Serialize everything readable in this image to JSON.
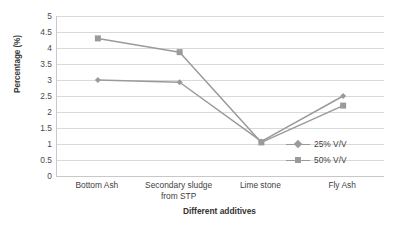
{
  "chart_data": {
    "type": "line",
    "title": "",
    "xlabel": "Different additives",
    "ylabel": "Percentage (%)",
    "categories": [
      "Bottom Ash",
      "Secondary sludge from STP",
      "Lime stone",
      "Fly Ash"
    ],
    "category_lines": [
      [
        "Bottom Ash"
      ],
      [
        "Secondary sludge",
        "from STP"
      ],
      [
        "Lime stone"
      ],
      [
        "Fly Ash"
      ]
    ],
    "series": [
      {
        "name": "25% V/V",
        "marker": "diamond",
        "color": "#9a9a9a",
        "values": [
          3.0,
          2.93,
          1.08,
          2.5
        ]
      },
      {
        "name": "50% V/V",
        "marker": "square",
        "color": "#9a9a9a",
        "values": [
          4.3,
          3.87,
          1.05,
          2.2
        ]
      }
    ],
    "ylim": [
      0,
      5
    ],
    "ytick_step": 0.5,
    "ytick_labels": [
      "5",
      "4.5",
      "4",
      "3.5",
      "3",
      "2.5",
      "2",
      "1.5",
      "1",
      "0.5",
      "0"
    ],
    "grid": "horizontal",
    "legend_position": "inside-right-lower",
    "line_color": "#9a9a9a",
    "gridline_color": "#d9d9d9",
    "axis_color": "#c8c8c8",
    "background": "#ffffff"
  }
}
